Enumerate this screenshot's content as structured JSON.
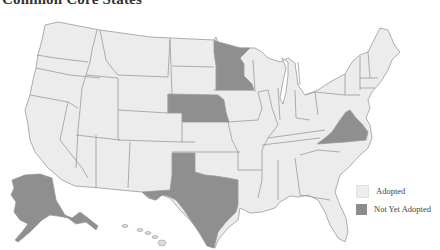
{
  "title": "Common Core States",
  "legend": {
    "items": [
      {
        "label": "Adopted",
        "color": "#ececec"
      },
      {
        "label": "Not Yet Adopted",
        "color": "#8f8f8f"
      }
    ]
  },
  "map": {
    "region": "United States",
    "states_not_yet_adopted": [
      "Alaska",
      "Texas",
      "Nebraska",
      "Minnesota",
      "Virginia"
    ],
    "colors": {
      "adopted": "#ececec",
      "not_yet_adopted": "#8f8f8f",
      "border": "#9a9a9a"
    }
  }
}
